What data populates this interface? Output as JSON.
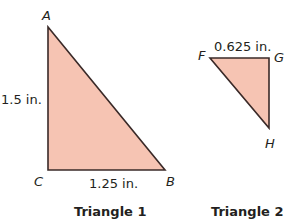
{
  "colors": {
    "fill": "#f6c4b3",
    "stroke": "#3a2a28",
    "text": "#231f20"
  },
  "triangle1": {
    "caption": "Triangle 1",
    "vertices": {
      "A": "A",
      "B": "B",
      "C": "C"
    },
    "side_ac": "1.5 in.",
    "side_cb": "1.25 in."
  },
  "triangle2": {
    "caption": "Triangle 2",
    "vertices": {
      "F": "F",
      "G": "G",
      "H": "H"
    },
    "side_fg": "0.625 in."
  }
}
